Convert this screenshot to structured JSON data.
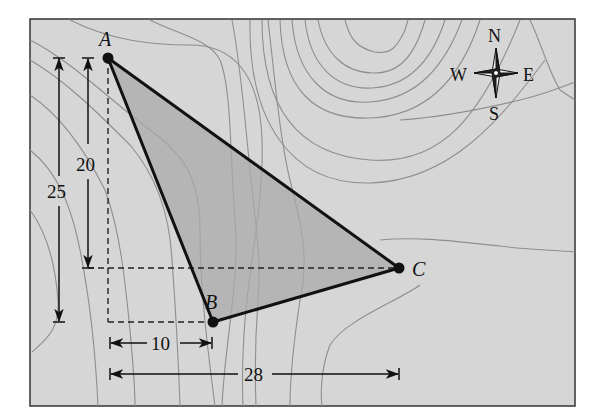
{
  "figure": {
    "colors": {
      "map_background": "#d6d6d6",
      "triangle_fill": "#a9a9a9",
      "contour": "#8e8e8e",
      "ink": "#111111",
      "frame": "#333333"
    }
  },
  "points": {
    "A": {
      "label": "A",
      "x": 108,
      "y": 58
    },
    "B": {
      "label": "B",
      "x": 213,
      "y": 322
    },
    "C": {
      "label": "C",
      "x": 399,
      "y": 268
    }
  },
  "dimensions": {
    "vertical_outer": {
      "label": "25",
      "description": "vertical distance from A to B"
    },
    "vertical_inner": {
      "label": "20",
      "description": "vertical distance from A to C"
    },
    "horizontal_short": {
      "label": "10",
      "description": "horizontal distance from A to B"
    },
    "horizontal_long": {
      "label": "28",
      "description": "horizontal distance from A to C"
    }
  },
  "compass": {
    "north": "N",
    "south": "S",
    "east": "E",
    "west": "W"
  }
}
